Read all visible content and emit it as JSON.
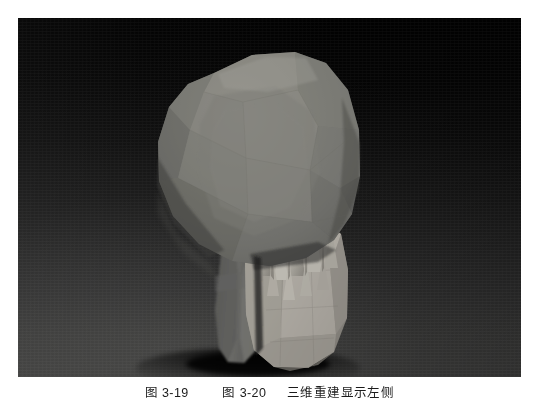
{
  "figure": {
    "kind": "3d-surface-rendered-ct-reconstruction",
    "render_style": "low-polygon faceted surface rendering",
    "panel": {
      "x": 18,
      "y": 18,
      "width": 503,
      "height": 359,
      "background_top_color": "#010101",
      "background_bottom_color": "#3d3d3c",
      "background_description": "dark vertical gradient, near black at top fading to dark gray at bottom"
    },
    "page_background_color": "#ffffff"
  },
  "object_colors": {
    "cranium_midtone": "#7a7a78",
    "cranium_highlight": "#96958f",
    "cranium_shadow": "#5a5a58",
    "cranium_deep_shadow": "#3f3f3e",
    "ramus_column": "#6d6d6a",
    "ramus_shadow": "#4a4a48",
    "tooth_roots_bright": "#b8b5ad",
    "tooth_roots_mid": "#a19e96",
    "tooth_roots_shadow": "#7f7c75",
    "body_bright": "#b0aca4",
    "contact_shadow": "#171716"
  },
  "caption": {
    "segment_1": "图 3-19",
    "segment_2": "图 3-20",
    "segment_3": "三维重建显示左侧",
    "clipped": "true",
    "note": "caption is cut off at the bottom edge of the page; only the tops of the glyphs are visible"
  }
}
